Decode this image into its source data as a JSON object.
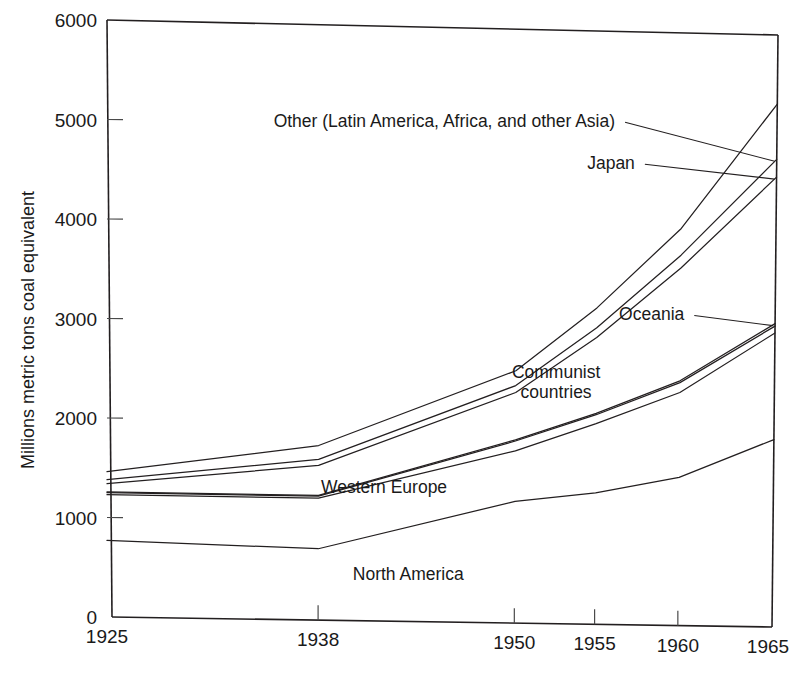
{
  "chart_data": {
    "type": "line",
    "title": "",
    "xlabel": "",
    "ylabel": "Millions metric tons coal equivalent",
    "x": [
      1925,
      1938,
      1950,
      1955,
      1960,
      1965
    ],
    "xtick_labels": [
      "1925",
      "1938",
      "1950",
      "1955",
      "1960",
      "1965"
    ],
    "ytick_labels": [
      "0",
      "1000",
      "2000",
      "3000",
      "4000",
      "5000",
      "6000"
    ],
    "yticks": [
      0,
      1000,
      2000,
      3000,
      4000,
      5000,
      6000
    ],
    "ylim": [
      0,
      6000
    ],
    "xlim": [
      1925,
      1965
    ],
    "grid": false,
    "legend": "inline-labels",
    "note": "Cumulative (stacked) curves of world energy consumption; each curve is a running total.",
    "series": [
      {
        "name": "North America",
        "label": "North America",
        "values": [
          770,
          720,
          1230,
          1330,
          1500,
          1900
        ],
        "label_x": 1943.5,
        "label_y": 420,
        "anchor": "mid",
        "leader": false
      },
      {
        "name": "Western Europe",
        "label": "Western Europe",
        "values": [
          1230,
          1230,
          1740,
          2030,
          2360,
          2980
        ],
        "label_x": 1942.0,
        "label_y": 1290,
        "anchor": "mid",
        "leader": false
      },
      {
        "name": "Communist countries",
        "label": "Communist countries",
        "values": [
          1250,
          1250,
          1840,
          2120,
          2460,
          3050
        ],
        "label_x": 1952.5,
        "label_y": 2480,
        "anchor": "mid",
        "leader": false
      },
      {
        "name": "Oceania",
        "label": "Oceania",
        "values": [
          1258,
          1258,
          1852,
          2134,
          2478,
          3075
        ],
        "label_x": 1960.2,
        "label_y": 3090,
        "anchor": "end",
        "leader": true
      },
      {
        "name": "Japan",
        "label": "Japan",
        "values": [
          1340,
          1560,
          2330,
          2900,
          3620,
          4560
        ],
        "label_x": 1957.2,
        "label_y": 4610,
        "anchor": "end",
        "leader": true
      },
      {
        "name": "Other (Latin America, Africa, and other Asia)",
        "label": "Other (Latin America, Africa, and other Asia)",
        "values": [
          1380,
          1620,
          2400,
          3000,
          3750,
          4740
        ],
        "label_x": 1956.0,
        "label_y": 5030,
        "anchor": "end",
        "leader": true
      },
      {
        "name": "Total",
        "label": "",
        "values": [
          1460,
          1760,
          2550,
          3200,
          4020,
          5300
        ],
        "label_x": null,
        "label_y": null,
        "anchor": "end",
        "leader": false
      }
    ],
    "colors": {
      "line": "#231f20",
      "axis": "#231f20",
      "background": "#ffffff",
      "text": "#1a1a1a"
    }
  }
}
